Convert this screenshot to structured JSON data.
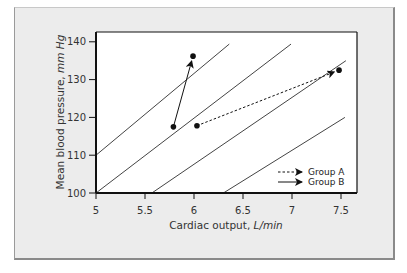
{
  "chart_data": {
    "type": "line",
    "title": "",
    "xlabel": "Cardiac output, L/min",
    "xlabel_main": "Cardiac output, ",
    "xlabel_unit": "L/min",
    "ylabel": "Mean blood pressure, mm Hg",
    "ylabel_main": "Mean blood pressure, ",
    "ylabel_unit": "mm Hg",
    "xlim": [
      5,
      7.75
    ],
    "ylim": [
      100,
      141
    ],
    "x_ticks": [
      5,
      5.5,
      6,
      6.5,
      7,
      7.5
    ],
    "x_tick_labels": [
      "5",
      "5.5",
      "6",
      "6.5",
      "7",
      "7.5"
    ],
    "y_ticks": [
      100,
      110,
      120,
      130,
      140
    ],
    "y_tick_labels": [
      "100",
      "110",
      "120",
      "130",
      "140"
    ],
    "grid": false,
    "legend_position": "lower right",
    "reference_lines": [
      {
        "x": [
          5.0,
          6.36
        ],
        "y": [
          110,
          139.4
        ]
      },
      {
        "x": [
          5.0,
          6.99
        ],
        "y": [
          100,
          139.4
        ]
      },
      {
        "x": [
          5.57,
          7.55
        ],
        "y": [
          100,
          135.0
        ]
      },
      {
        "x": [
          6.3,
          7.54
        ],
        "y": [
          100,
          120.0
        ]
      }
    ],
    "series": [
      {
        "name": "Group A",
        "style": "dashed-arrow",
        "start": {
          "x": 6.03,
          "y": 117.8
        },
        "end": {
          "x": 7.48,
          "y": 132.5
        }
      },
      {
        "name": "Group B",
        "style": "solid-arrow",
        "start": {
          "x": 5.79,
          "y": 117.5
        },
        "end": {
          "x": 5.99,
          "y": 136.2
        }
      }
    ],
    "legend": [
      {
        "label": "Group A",
        "style": "dashed"
      },
      {
        "label": "Group B",
        "style": "solid"
      }
    ]
  }
}
